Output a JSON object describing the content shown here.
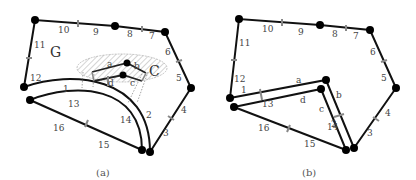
{
  "panels": [
    {
      "caption": "(a)",
      "region_label": "G",
      "component_label": "C",
      "outer_edge_labels": [
        "1",
        "2",
        "3",
        "4",
        "5",
        "6",
        "7",
        "8",
        "9",
        "10",
        "11",
        "12",
        "13",
        "14",
        "15",
        "16"
      ],
      "inner_edge_labels": [
        "a",
        "b",
        "c",
        "d"
      ]
    },
    {
      "caption": "(b)",
      "outer_edge_labels": [
        "1",
        "2",
        "3",
        "4",
        "5",
        "6",
        "7",
        "8",
        "9",
        "10",
        "11",
        "12",
        "13",
        "14",
        "15",
        "16"
      ],
      "inner_edge_labels": [
        "a",
        "b",
        "c",
        "d"
      ]
    }
  ],
  "colors": {
    "edge": "#111111",
    "vertex": "#000000",
    "tick": "#888888",
    "hatch": "#aaaaaa",
    "label": "#444444"
  }
}
